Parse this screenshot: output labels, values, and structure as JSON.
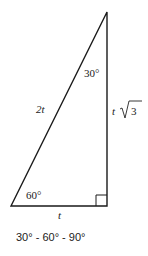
{
  "diagram": {
    "title": "30° - 60° - 90°",
    "type": "right-triangle",
    "angles": {
      "top": "30°",
      "bottom_left": "60°",
      "bottom_right": "right-angle"
    },
    "sides": {
      "hypotenuse": "2t",
      "short_leg": "t",
      "long_leg_coef": "t",
      "long_leg_radicand": "3"
    },
    "colors": {
      "stroke": "#1a1a1a",
      "background": "#ffffff"
    }
  }
}
